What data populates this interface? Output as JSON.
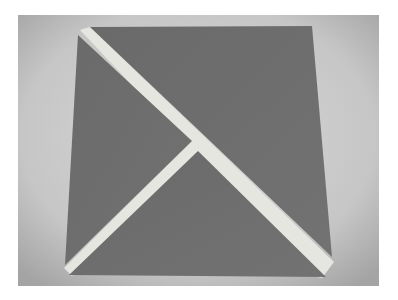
{
  "image": {
    "description": "Grayscale photo of a dark square cut into three pieces (two triangles and one larger triangle) separated by white strips, on a gray background",
    "colors": {
      "page": "#ffffff",
      "background_light": "#d4d4d4",
      "background_dark": "#a9a9a9",
      "piece": "#6e6e6e",
      "strip": "#e6e6e0"
    },
    "pieces": [
      {
        "name": "top-right-triangle",
        "points": "90,27 312,26 332,257"
      },
      {
        "name": "left-triangle",
        "points": "78,35 192,141 65,265"
      },
      {
        "name": "bottom-triangle",
        "points": "198,151 326,277 69,275"
      }
    ]
  }
}
